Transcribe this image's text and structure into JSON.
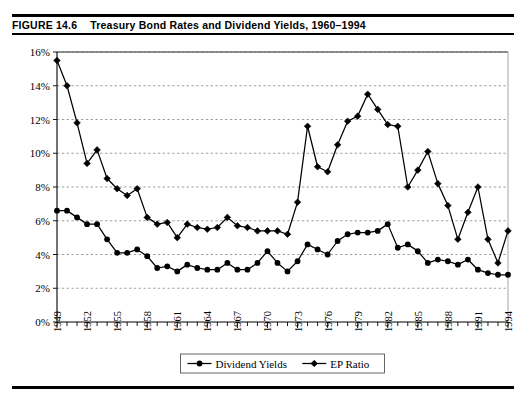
{
  "figure": {
    "label": "FIGURE 14.6",
    "title": "Treasury Bond Rates and Dividend Yields, 1960–1994"
  },
  "colors": {
    "ink": "#000000",
    "grid": "#8a8a8a",
    "background": "#ffffff"
  },
  "chart_data": {
    "type": "line",
    "title": "Treasury Bond Rates and Dividend Yields, 1960–1994",
    "xlabel": "",
    "ylabel": "",
    "ylim": [
      0,
      16
    ],
    "ytick_values": [
      0,
      2,
      4,
      6,
      8,
      10,
      12,
      14,
      16
    ],
    "ytick_labels": [
      "0%",
      "2%",
      "4%",
      "6%",
      "8%",
      "10%",
      "12%",
      "14%",
      "16%"
    ],
    "grid": true,
    "grid_axis": "y",
    "legend_position": "bottom",
    "x": [
      1949,
      1950,
      1951,
      1952,
      1953,
      1954,
      1955,
      1956,
      1957,
      1958,
      1959,
      1960,
      1961,
      1962,
      1963,
      1964,
      1965,
      1966,
      1967,
      1968,
      1969,
      1970,
      1971,
      1972,
      1973,
      1974,
      1975,
      1976,
      1977,
      1978,
      1979,
      1980,
      1981,
      1982,
      1983,
      1984,
      1985,
      1986,
      1987,
      1988,
      1989,
      1990,
      1991,
      1992,
      1993,
      1994
    ],
    "xtick_labels": [
      "1949",
      "1952",
      "1955",
      "1958",
      "1961",
      "1964",
      "1967",
      "1970",
      "1973",
      "1976",
      "1979",
      "1982",
      "1985",
      "1988",
      "1991",
      "1994"
    ],
    "xtick_every": 3,
    "series": [
      {
        "name": "Dividend Yields",
        "marker": "circle",
        "values": [
          6.6,
          6.6,
          6.2,
          5.8,
          5.8,
          4.9,
          4.1,
          4.1,
          4.3,
          3.9,
          3.2,
          3.3,
          3.0,
          3.4,
          3.2,
          3.1,
          3.1,
          3.5,
          3.1,
          3.1,
          3.5,
          4.2,
          3.5,
          3.0,
          3.6,
          4.6,
          4.3,
          4.0,
          4.8,
          5.2,
          5.3,
          5.3,
          5.4,
          5.8,
          4.4,
          4.6,
          4.2,
          3.5,
          3.7,
          3.6,
          3.4,
          3.7,
          3.1,
          2.9,
          2.8,
          2.8
        ]
      },
      {
        "name": "EP Ratio",
        "marker": "diamond",
        "values": [
          15.5,
          14.0,
          11.8,
          9.4,
          10.2,
          8.5,
          7.9,
          7.5,
          7.9,
          6.2,
          5.8,
          5.9,
          5.0,
          5.8,
          5.6,
          5.5,
          5.6,
          6.2,
          5.7,
          5.6,
          5.4,
          5.4,
          5.4,
          5.2,
          7.1,
          11.6,
          9.2,
          8.9,
          10.5,
          11.9,
          12.2,
          13.5,
          12.6,
          11.7,
          11.6,
          8.0,
          9.0,
          10.1,
          8.2,
          6.9,
          4.9,
          6.5,
          8.0,
          4.9,
          3.5,
          5.4
        ]
      }
    ]
  },
  "legend": {
    "items": [
      {
        "label": "Dividend Yields",
        "marker": "circle"
      },
      {
        "label": "EP Ratio",
        "marker": "diamond"
      }
    ]
  }
}
